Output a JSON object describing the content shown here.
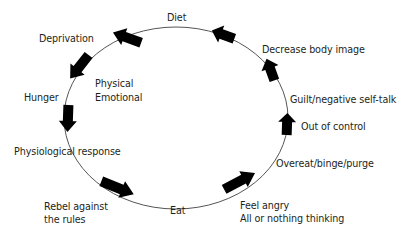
{
  "diagram": {
    "type": "cycle",
    "colors": {
      "line": "#555555",
      "arrow": "#000000",
      "text": "#231f20"
    },
    "labels": {
      "diet": "Diet",
      "deprivation": "Deprivation",
      "physical": "Physical",
      "emotional": "Emotional",
      "hunger": "Hunger",
      "physiological_response": "Physiological response",
      "rebel_line1": "Rebel against",
      "rebel_line2": "the rules",
      "eat": "Eat",
      "feel_angry": "Feel angry",
      "all_or_nothing": "All or nothing thinking",
      "overeat": "Overeat/binge/purge",
      "out_of_control": "Out of control",
      "guilt": "Guilt/negative self-talk",
      "decrease_body_image": "Decrease body image"
    },
    "sequence": [
      "Diet",
      "Deprivation",
      "Hunger",
      "Physiological response",
      "Rebel against the rules",
      "Eat",
      "Feel angry / All or nothing thinking",
      "Overeat/binge/purge",
      "Out of control",
      "Guilt/negative self-talk",
      "Decrease body image"
    ]
  }
}
